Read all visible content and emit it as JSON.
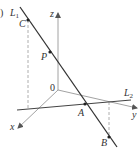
{
  "figure": {
    "panel_marker": ")",
    "lines": {
      "L1": {
        "label": "L",
        "subscript": "1"
      },
      "L2": {
        "label": "L",
        "subscript": "2"
      }
    },
    "axes": {
      "x": {
        "label": "x"
      },
      "y": {
        "label": "y"
      },
      "z": {
        "label": "z"
      },
      "origin": {
        "label": "0"
      }
    },
    "points": [
      {
        "id": "C",
        "label": "C"
      },
      {
        "id": "P",
        "label": "P"
      },
      {
        "id": "A",
        "label": "A"
      },
      {
        "id": "B",
        "label": "B"
      }
    ],
    "colors": {
      "line": "#333333",
      "axis": "#8a8a8a",
      "dashed": "#999999"
    }
  }
}
